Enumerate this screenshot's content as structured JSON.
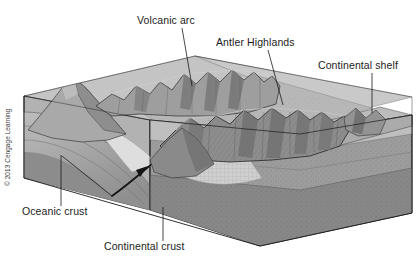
{
  "figure": {
    "background_color": "#ffffff"
  },
  "labels": [
    {
      "id": "volcanic-arc",
      "text": "Volcanic arc",
      "text_x": 137,
      "text_y": 24,
      "leader": "M 182 28 L 192 86"
    },
    {
      "id": "antler-highlands",
      "text": "Antler Highlands",
      "text_x": 216,
      "text_y": 46,
      "leader": "M 268 50 L 283 105"
    },
    {
      "id": "continental-shelf",
      "text": "Continental shelf",
      "text_x": 318,
      "text_y": 69,
      "leader": "M 372 73 L 372 113"
    },
    {
      "id": "oceanic-crust",
      "text": "Oceanic crust",
      "text_x": 22,
      "text_y": 215,
      "leader": "M 61 206 L 61 155"
    },
    {
      "id": "continental-crust",
      "text": "Continental crust",
      "text_x": 104,
      "text_y": 250,
      "leader": "M 163 241 L 163 207"
    }
  ],
  "copyright": {
    "text": "© 2013 Cengage Learning",
    "x": 10,
    "y": 186
  },
  "palette": {
    "sea_surface": "#c2c2c2",
    "top_plateau": "#b9b9b9",
    "shelf_surface": "#bdbdbd",
    "front_face_upper": "#a8a8a8",
    "front_face_stipple": "#9a9a9a",
    "front_face_lower": "#8a8a8a",
    "deep_mantle": "#7b7b7b",
    "left_face": "#b0b0b0",
    "left_face_band": "#c8c8c8",
    "oceanic_slab": "#9d9d9d",
    "mountain_light": "#b4b4b4",
    "mountain_mid": "#9b9b9b",
    "mountain_dark": "#828282",
    "mountain_shadow": "#6e6e6e",
    "highland_body": "#8f8f8f",
    "outline": "#1a1a1a",
    "fault_line": "#141414",
    "label_text": "#1c1c1c",
    "trench_light": "#dcdcdc",
    "sediment_wedge": "#d2d2d2"
  }
}
